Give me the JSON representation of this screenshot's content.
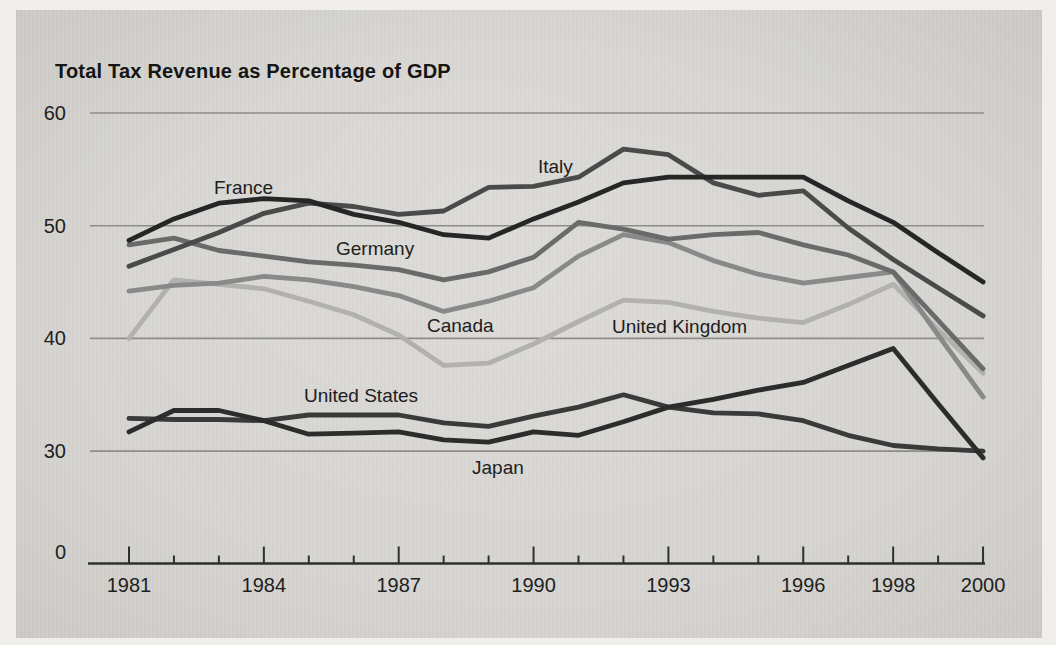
{
  "figure": {
    "background_color": "#d8d6d2",
    "page_edge_color": "#f0efeb",
    "text_color": "#20201e",
    "axis_color": "#2f2f2f",
    "gridline_color": "#8e8d8a"
  },
  "chart_data": {
    "type": "line",
    "title": "Total Tax Revenue as Percentage of GDP",
    "xlabel": "",
    "ylabel": "",
    "x": [
      1981,
      1982,
      1983,
      1984,
      1985,
      1986,
      1987,
      1988,
      1989,
      1990,
      1991,
      1992,
      1993,
      1994,
      1995,
      1996,
      1997,
      1998,
      1999,
      2000
    ],
    "x_axis": {
      "labeled_years": [
        1981,
        1984,
        1987,
        1990,
        1993,
        1996,
        1998,
        2000
      ],
      "tick_labels": [
        "1981",
        "1984",
        "1987",
        "1990",
        "1993",
        "1996",
        "1998",
        "2000"
      ],
      "minor_ticks": "every year"
    },
    "y_axis": {
      "tick_values": [
        60,
        50,
        40,
        30,
        0
      ],
      "tick_labels": [
        "60",
        "50",
        "40",
        "30",
        "0"
      ],
      "scale_break_between_0_and_30": true,
      "gridlines_at": [
        60,
        50,
        40,
        30
      ]
    },
    "ylim": [
      0,
      60
    ],
    "grid": "horizontal only",
    "legend": "inline labels next to lines",
    "values_note": "values estimated from plot, percent of GDP",
    "series": [
      {
        "name": "France",
        "color": "#262626",
        "values": [
          48.7,
          50.6,
          52.0,
          52.4,
          52.2,
          51.0,
          50.3,
          49.2,
          48.9,
          50.6,
          52.1,
          53.8,
          54.3,
          54.3,
          54.3,
          54.3,
          52.2,
          50.3,
          47.6,
          45.0
        ]
      },
      {
        "name": "Italy",
        "color": "#4a4a4a",
        "values": [
          46.4,
          47.9,
          49.4,
          51.1,
          52.0,
          51.7,
          51.0,
          51.3,
          53.4,
          53.5,
          54.3,
          56.8,
          56.3,
          53.8,
          52.7,
          53.1,
          49.8,
          47.0,
          44.5,
          42.0
        ]
      },
      {
        "name": "Germany",
        "color": "#6a6a6a",
        "values": [
          48.3,
          48.9,
          47.8,
          47.3,
          46.8,
          46.5,
          46.1,
          45.2,
          45.9,
          47.2,
          50.3,
          49.7,
          48.8,
          49.2,
          49.4,
          48.3,
          47.4,
          45.9,
          41.6,
          37.3
        ]
      },
      {
        "name": "Canada",
        "color": "#898989",
        "values": [
          44.2,
          44.7,
          44.9,
          45.5,
          45.2,
          44.6,
          43.8,
          42.4,
          43.3,
          44.5,
          47.3,
          49.2,
          48.5,
          46.9,
          45.7,
          44.9,
          45.4,
          45.9,
          40.3,
          34.8
        ]
      },
      {
        "name": "United Kingdom",
        "color": "#b2b1ae",
        "values": [
          40.0,
          45.2,
          44.8,
          44.4,
          43.3,
          42.1,
          40.3,
          37.6,
          37.8,
          39.5,
          41.5,
          43.4,
          43.2,
          42.4,
          41.8,
          41.4,
          43.0,
          44.8,
          40.8,
          36.9
        ]
      },
      {
        "name": "United States",
        "color": "#3a3a3a",
        "values": [
          32.9,
          32.8,
          32.8,
          32.7,
          33.2,
          33.2,
          33.2,
          32.5,
          32.2,
          33.1,
          33.9,
          35.0,
          33.9,
          33.4,
          33.3,
          32.7,
          31.4,
          30.5,
          30.2,
          30.0
        ]
      },
      {
        "name": "Japan",
        "color": "#2c2c2c",
        "values": [
          31.7,
          33.6,
          33.6,
          32.7,
          31.5,
          31.6,
          31.7,
          31.0,
          30.8,
          31.7,
          31.4,
          32.6,
          33.9,
          34.6,
          35.4,
          36.1,
          37.6,
          39.1,
          34.2,
          29.4
        ]
      }
    ]
  }
}
